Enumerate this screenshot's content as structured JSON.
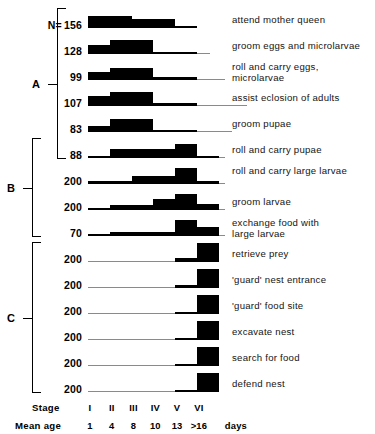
{
  "figure": {
    "n_prefix": "N=",
    "days_unit": "days",
    "stage_axis_title": "Stage",
    "meanage_axis_title": "Mean age"
  },
  "groups": [
    {
      "label": "A",
      "first_row": 0,
      "last_row": 5
    },
    {
      "label": "B",
      "first_row": 5,
      "last_row": 8
    },
    {
      "label": "C",
      "first_row": 9,
      "last_row": 14
    }
  ],
  "chart_data": {
    "type": "bar",
    "title": "",
    "subtitle": "",
    "xlabel": "Stage",
    "ylabel": "",
    "grid": false,
    "legend_position": "none",
    "categories": [
      "I",
      "II",
      "III",
      "IV",
      "V",
      "VI"
    ],
    "stage_labels": [
      "I",
      "II",
      "III",
      "IV",
      "V",
      "VI"
    ],
    "mean_age_labels": [
      "1",
      "4",
      "8",
      "10",
      "13",
      ">16"
    ],
    "mean_age_unit": "days",
    "ylim": [
      0,
      1
    ],
    "note": "values are relative task-performance frequency per developmental stage (0-1); baseline_extent = number of stages the zero-line is drawn across",
    "series": [
      {
        "name": "attend mother queen",
        "group": "A",
        "n": 156,
        "values": [
          0.62,
          0.62,
          0.46,
          0.46,
          0.1,
          0.0
        ],
        "baseline_extent": 5.0
      },
      {
        "name": "groom eggs and microlarvae",
        "group": "A",
        "n": 128,
        "values": [
          0.5,
          0.72,
          0.72,
          0.1,
          0.1,
          0.0
        ],
        "baseline_extent": 5.6
      },
      {
        "name": "roll and carry eggs, microlarvae",
        "group": "A",
        "n": 99,
        "values": [
          0.4,
          0.62,
          0.62,
          0.16,
          0.16,
          0.0
        ],
        "baseline_extent": 6.3
      },
      {
        "name": "assist eclosion of adults",
        "group": "A",
        "n": 107,
        "values": [
          0.52,
          0.74,
          0.74,
          0.18,
          0.18,
          0.0
        ],
        "baseline_extent": 7.3
      },
      {
        "name": "groom pupae",
        "group": "A",
        "n": 83,
        "values": [
          0.34,
          0.7,
          0.7,
          0.06,
          0.06,
          0.0
        ],
        "baseline_extent": 6.6
      },
      {
        "name": "roll and carry pupae",
        "group": "B",
        "n": 88,
        "values": [
          0.06,
          0.46,
          0.46,
          0.46,
          0.74,
          0.06
        ],
        "baseline_extent": 6.3
      },
      {
        "name": "roll and carry large larvae",
        "group": "B",
        "n": 200,
        "values": [
          0.18,
          0.18,
          0.42,
          0.42,
          0.86,
          0.18
        ],
        "baseline_extent": 6.3
      },
      {
        "name": "groom larvae",
        "group": "B",
        "n": 200,
        "values": [
          0.04,
          0.24,
          0.24,
          0.56,
          0.82,
          0.3
        ],
        "baseline_extent": 6.3
      },
      {
        "name": "exchange food with large larvae",
        "group": "B",
        "n": 70,
        "values": [
          0.02,
          0.22,
          0.22,
          0.22,
          0.86,
          0.5
        ],
        "baseline_extent": 6.3
      },
      {
        "name": "retrieve prey",
        "group": "C",
        "n": 200,
        "values": [
          0.0,
          0.0,
          0.0,
          0.0,
          0.2,
          1.0
        ],
        "baseline_extent": 5.6
      },
      {
        "name": "'guard' nest entrance",
        "group": "C",
        "n": 200,
        "values": [
          0.0,
          0.0,
          0.0,
          0.0,
          0.18,
          1.0
        ],
        "baseline_extent": 5.6
      },
      {
        "name": "'guard' food site",
        "group": "C",
        "n": 200,
        "values": [
          0.0,
          0.0,
          0.0,
          0.0,
          0.05,
          1.0
        ],
        "baseline_extent": 5.6
      },
      {
        "name": "excavate nest",
        "group": "C",
        "n": 200,
        "values": [
          0.0,
          0.0,
          0.0,
          0.0,
          0.05,
          1.0
        ],
        "baseline_extent": 5.6
      },
      {
        "name": "search for food",
        "group": "C",
        "n": 200,
        "values": [
          0.0,
          0.0,
          0.0,
          0.0,
          0.05,
          1.0
        ],
        "baseline_extent": 5.6
      },
      {
        "name": "defend nest",
        "group": "C",
        "n": 200,
        "values": [
          0.0,
          0.0,
          0.0,
          0.0,
          0.05,
          1.0
        ],
        "baseline_extent": 5.6
      }
    ]
  },
  "colors": {
    "bar_fill": "#000000",
    "baseline": "#8a8a8a",
    "text": "#000000",
    "background": "#ffffff"
  }
}
